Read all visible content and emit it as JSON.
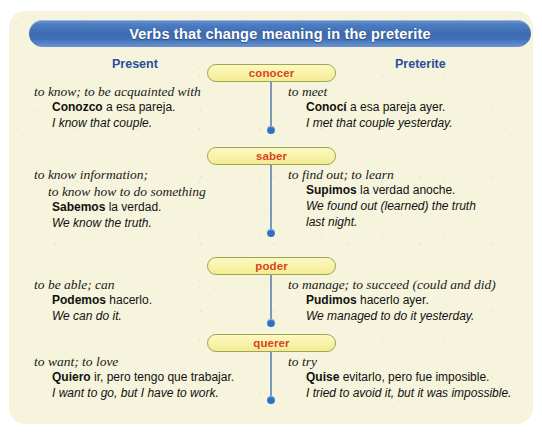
{
  "title": "Verbs that change meaning in the preterite",
  "columns": {
    "present": "Present",
    "preterite": "Preterite"
  },
  "rows": [
    {
      "verb": "conocer",
      "present": {
        "gloss": [
          "to know; to be acquainted with"
        ],
        "example_bold": "Conozco",
        "example_rest": " a esa pareja.",
        "translation": [
          "I know that couple."
        ]
      },
      "preterite": {
        "gloss": [
          "to meet"
        ],
        "example_bold": "Conocí",
        "example_rest": " a esa pareja ayer.",
        "translation": [
          "I met that couple yesterday."
        ]
      }
    },
    {
      "verb": "saber",
      "present": {
        "gloss": [
          "to know information;",
          "to know how to do something"
        ],
        "example_bold": "Sabemos",
        "example_rest": " la verdad.",
        "translation": [
          "We know the truth."
        ]
      },
      "preterite": {
        "gloss": [
          "to find out; to learn"
        ],
        "example_bold": "Supimos",
        "example_rest": " la verdad anoche.",
        "translation": [
          "We found out (learned) the truth",
          "last night."
        ]
      }
    },
    {
      "verb": "poder",
      "present": {
        "gloss": [
          "to be able; can"
        ],
        "example_bold": "Podemos",
        "example_rest": " hacerlo.",
        "translation": [
          "We can do it."
        ]
      },
      "preterite": {
        "gloss": [
          "to manage; to succeed (could and did)"
        ],
        "example_bold": "Pudimos",
        "example_rest": " hacerlo ayer.",
        "translation": [
          "We managed to do it yesterday."
        ]
      }
    },
    {
      "verb": "querer",
      "present": {
        "gloss": [
          "to want; to love"
        ],
        "example_bold": "Quiero",
        "example_rest": " ir, pero tengo que trabajar.",
        "translation": [
          "I want to go, but I have to work."
        ]
      },
      "preterite": {
        "gloss": [
          "to try"
        ],
        "example_bold": "Quise",
        "example_rest": " evitarlo, pero fue imposible.",
        "translation": [
          "I tried to avoid it, but it was impossible."
        ]
      }
    }
  ],
  "colors": {
    "title_bar": "#3e6cb4",
    "card_background": "#f6f4dc",
    "column_header": "#2a4f9b",
    "pill_fill": "#f9f2a8",
    "pill_border": "#9aa84f",
    "pill_text": "#d9441f",
    "connector_dot": "#2f6fc4"
  }
}
